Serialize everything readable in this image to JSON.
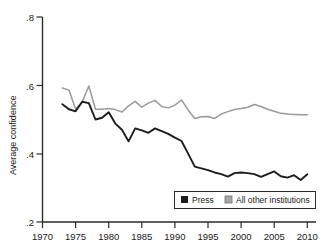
{
  "chart_data": {
    "type": "line",
    "title": "",
    "xlabel": "",
    "ylabel": "Average confidence",
    "xlim": [
      1970,
      2010
    ],
    "ylim": [
      0.2,
      0.8
    ],
    "grid": false,
    "legend_position": "bottom-right",
    "x_ticks": [
      "1970",
      "1975",
      "1980",
      "1985",
      "1990",
      "1995",
      "2000",
      "2005",
      "2010"
    ],
    "y_ticks": [
      ".8",
      ".6",
      ".4",
      ".2"
    ],
    "x": [
      1973,
      1974,
      1975,
      1976,
      1977,
      1978,
      1979,
      1980,
      1981,
      1982,
      1983,
      1984,
      1985,
      1986,
      1987,
      1988,
      1989,
      1990,
      1991,
      1992,
      1993,
      1994,
      1995,
      1996,
      1997,
      1998,
      1999,
      2000,
      2001,
      2002,
      2003,
      2004,
      2005,
      2006,
      2007,
      2008,
      2009,
      2010
    ],
    "series": [
      {
        "name": "Press",
        "color": "#1c1c1c",
        "values": [
          0.545,
          0.53,
          0.524,
          0.552,
          0.548,
          0.5,
          0.505,
          0.521,
          0.488,
          0.47,
          0.436,
          0.474,
          0.468,
          0.461,
          0.474,
          0.466,
          0.458,
          0.447,
          0.437,
          0.4,
          0.362,
          0.357,
          0.352,
          0.345,
          0.34,
          0.333,
          0.343,
          0.345,
          0.343,
          0.34,
          0.332,
          0.34,
          0.348,
          0.334,
          0.33,
          0.337,
          0.323,
          0.34
        ]
      },
      {
        "name": "All other institutions",
        "color": "#9a9a9a",
        "values": [
          0.592,
          0.586,
          0.53,
          0.552,
          0.598,
          0.53,
          0.53,
          0.532,
          0.529,
          0.522,
          0.54,
          0.553,
          0.536,
          0.548,
          0.556,
          0.538,
          0.534,
          0.542,
          0.557,
          0.528,
          0.503,
          0.508,
          0.509,
          0.503,
          0.516,
          0.523,
          0.529,
          0.532,
          0.536,
          0.544,
          0.538,
          0.53,
          0.524,
          0.518,
          0.516,
          0.515,
          0.514,
          0.514
        ]
      }
    ],
    "legend": [
      {
        "label": "Press",
        "swatch_color": "#1c1c1c"
      },
      {
        "label": "All other institutions",
        "swatch_color": "#a8a8a8"
      }
    ]
  }
}
